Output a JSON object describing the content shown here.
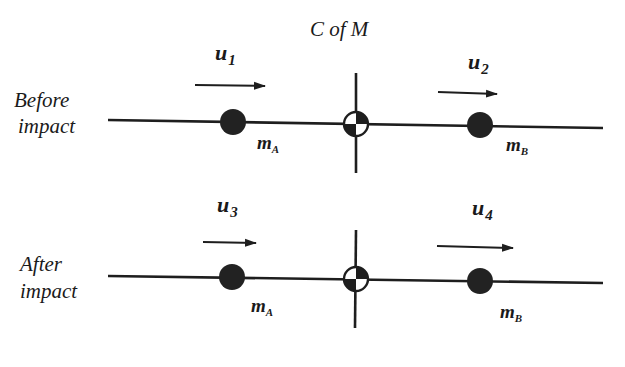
{
  "title": "C of M",
  "rows": [
    {
      "label_line1": "Before",
      "label_line2": "impact",
      "left_mass": {
        "symbol": "m",
        "subscript": "A"
      },
      "right_mass": {
        "symbol": "m",
        "subscript": "B"
      },
      "left_velocity": {
        "symbol": "u",
        "subscript": "1"
      },
      "right_velocity": {
        "symbol": "u",
        "subscript": "2"
      }
    },
    {
      "label_line1": "After",
      "label_line2": "impact",
      "left_mass": {
        "symbol": "m",
        "subscript": "A"
      },
      "right_mass": {
        "symbol": "m",
        "subscript": "B"
      },
      "left_velocity": {
        "symbol": "u",
        "subscript": "3"
      },
      "right_velocity": {
        "symbol": "u",
        "subscript": "4"
      }
    }
  ],
  "icons": {
    "center_of_mass": "center-of-mass-symbol",
    "ball": "filled-circle",
    "arrow": "right-arrow"
  },
  "colors": {
    "ink": "#1e1e1e",
    "background": "#ffffff"
  }
}
